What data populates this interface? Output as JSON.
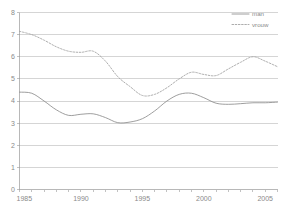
{
  "chart_data": {
    "type": "line",
    "title": "",
    "xlabel": "",
    "ylabel": "",
    "xlim": [
      1985,
      2006
    ],
    "ylim": [
      0,
      8
    ],
    "ytick_step": 1,
    "xtick_step": 1,
    "xlabel_step": 5,
    "grid": true,
    "legend_position": "top-right",
    "yticks": [
      "0",
      "1",
      "2",
      "3",
      "4",
      "5",
      "6",
      "7",
      "8"
    ],
    "xticks_major": [
      "1985",
      "1990",
      "1995",
      "2000",
      "2005"
    ],
    "x": [
      1985,
      1986,
      1987,
      1988,
      1989,
      1990,
      1991,
      1992,
      1993,
      1994,
      1995,
      1996,
      1997,
      1998,
      1999,
      2000,
      2001,
      2002,
      2003,
      2004,
      2005,
      2006
    ],
    "series": [
      {
        "name": "man",
        "style": "solid",
        "color": "#8c8c8c",
        "values": [
          4.4,
          4.35,
          4.0,
          3.6,
          3.35,
          3.4,
          3.42,
          3.25,
          3.02,
          3.05,
          3.2,
          3.55,
          4.0,
          4.3,
          4.35,
          4.15,
          3.9,
          3.85,
          3.88,
          3.92,
          3.92,
          3.95
        ]
      },
      {
        "name": "vrouw",
        "style": "dotted",
        "color": "#9e9e9e",
        "values": [
          7.15,
          7.0,
          6.75,
          6.45,
          6.25,
          6.2,
          6.25,
          5.8,
          5.1,
          4.65,
          4.25,
          4.3,
          4.6,
          5.0,
          5.3,
          5.2,
          5.15,
          5.45,
          5.75,
          6.0,
          5.8,
          5.55
        ]
      }
    ],
    "legend": [
      {
        "label": "man",
        "style": "solid"
      },
      {
        "label": "vrouw",
        "style": "dotted"
      }
    ]
  }
}
